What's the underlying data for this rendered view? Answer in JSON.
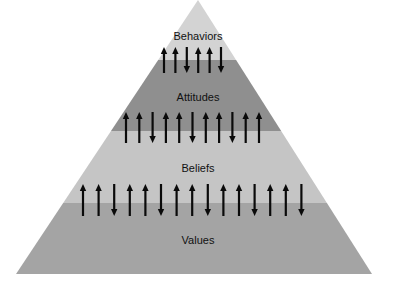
{
  "diagram": {
    "type": "pyramid",
    "apex": {
      "x": 198,
      "y": 0
    },
    "base": {
      "left": 16,
      "right": 372,
      "y": 274
    },
    "layers": [
      {
        "label": "Behaviors",
        "top": 0,
        "bottom": 60,
        "color": "#d3d3d3",
        "label_y": 40
      },
      {
        "label": "Attitudes",
        "top": 60,
        "bottom": 131,
        "color": "#8f8f8f",
        "label_y": 101
      },
      {
        "label": "Beliefs",
        "top": 131,
        "bottom": 203,
        "color": "#c5c5c5",
        "label_y": 172
      },
      {
        "label": "Values",
        "top": 203,
        "bottom": 274,
        "color": "#a4a4a4",
        "label_y": 244
      }
    ],
    "arrow_rows": [
      {
        "between": [
          "Behaviors",
          "Attitudes"
        ],
        "y_top": 47,
        "y_bottom": 73,
        "x_start": 164,
        "spacing": 11.4,
        "directions": [
          "up",
          "up",
          "down",
          "up",
          "up",
          "down"
        ]
      },
      {
        "between": [
          "Attitudes",
          "Beliefs"
        ],
        "y_top": 112,
        "y_bottom": 143,
        "x_start": 126,
        "spacing": 13.3,
        "directions": [
          "up",
          "up",
          "down",
          "up",
          "up",
          "down",
          "up",
          "up",
          "down",
          "up",
          "up"
        ]
      },
      {
        "between": [
          "Beliefs",
          "Values"
        ],
        "y_top": 184,
        "y_bottom": 216,
        "x_start": 83,
        "spacing": 15.6,
        "directions": [
          "up",
          "up",
          "down",
          "up",
          "up",
          "down",
          "up",
          "up",
          "down",
          "up",
          "up",
          "down",
          "up",
          "up",
          "down"
        ]
      }
    ],
    "arrow_color": "#0a0a0a"
  }
}
